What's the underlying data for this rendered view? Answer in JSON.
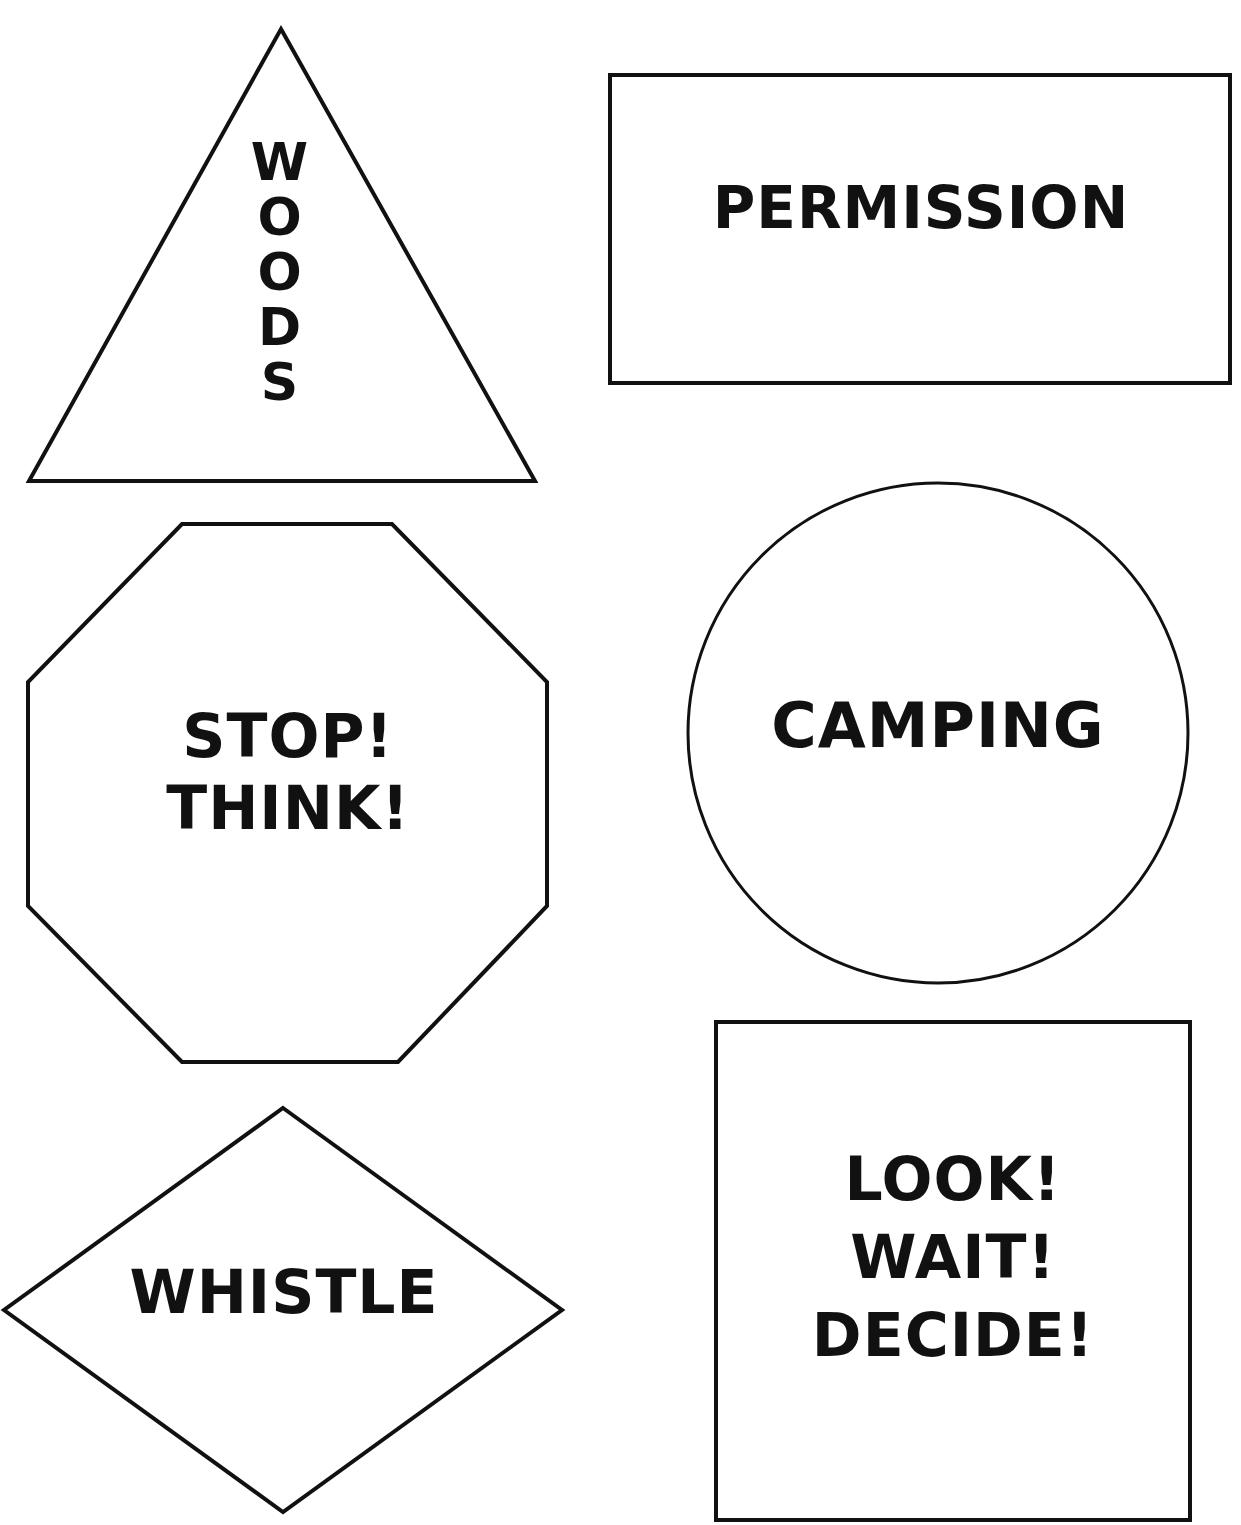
{
  "page": {
    "stroke_color": "#111111",
    "background_color": "#ffffff"
  },
  "signs": {
    "triangle": {
      "shape": "triangle",
      "text": "WOODS",
      "letters": [
        "W",
        "O",
        "O",
        "D",
        "S"
      ]
    },
    "rectangle": {
      "shape": "rectangle",
      "text": "PERMISSION"
    },
    "octagon": {
      "shape": "octagon",
      "lines": [
        "STOP!",
        "THINK!"
      ]
    },
    "circle": {
      "shape": "circle",
      "text": "CAMPING"
    },
    "diamond": {
      "shape": "diamond",
      "text": "WHISTLE"
    },
    "tall_rectangle": {
      "shape": "rectangle",
      "lines": [
        "LOOK!",
        "WAIT!",
        "DECIDE!"
      ]
    }
  }
}
